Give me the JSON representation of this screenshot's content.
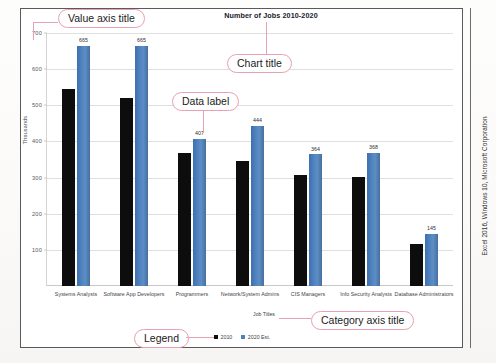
{
  "figure": {
    "credit": "Excel 2016, Windows 10, Microsoft Corporation"
  },
  "chart_data": {
    "type": "bar",
    "title": "Number of Jobs 2010-2020",
    "xlabel": "Job Titles",
    "ylabel": "Thousands",
    "ylim": [
      0,
      700
    ],
    "yticks": [
      100,
      200,
      300,
      400,
      500,
      600,
      700
    ],
    "grid": true,
    "legend_position": "bottom",
    "categories": [
      "Systems Analysts",
      "Software App Developers",
      "Programmers",
      "Network/System Admins",
      "CIS Managers",
      "Info Security Analysts",
      "Database Administrators"
    ],
    "series": [
      {
        "name": "2010",
        "color": "#0d0d0d",
        "values": [
          544,
          520,
          367,
          347,
          307,
          302,
          117
        ],
        "labels_shown": false
      },
      {
        "name": "2020 Est.",
        "color": "#4d80bd",
        "values": [
          665,
          665,
          407,
          444,
          364,
          368,
          145
        ],
        "labels": [
          "665",
          "665",
          "407",
          "444",
          "364",
          "368",
          "145"
        ],
        "labels_shown": true
      }
    ]
  },
  "annotations": [
    {
      "id": "value-axis-title",
      "text": "Value axis title"
    },
    {
      "id": "chart-title",
      "text": "Chart title"
    },
    {
      "id": "data-label",
      "text": "Data label"
    },
    {
      "id": "category-axis-title",
      "text": "Category axis title"
    },
    {
      "id": "legend",
      "text": "Legend"
    }
  ]
}
